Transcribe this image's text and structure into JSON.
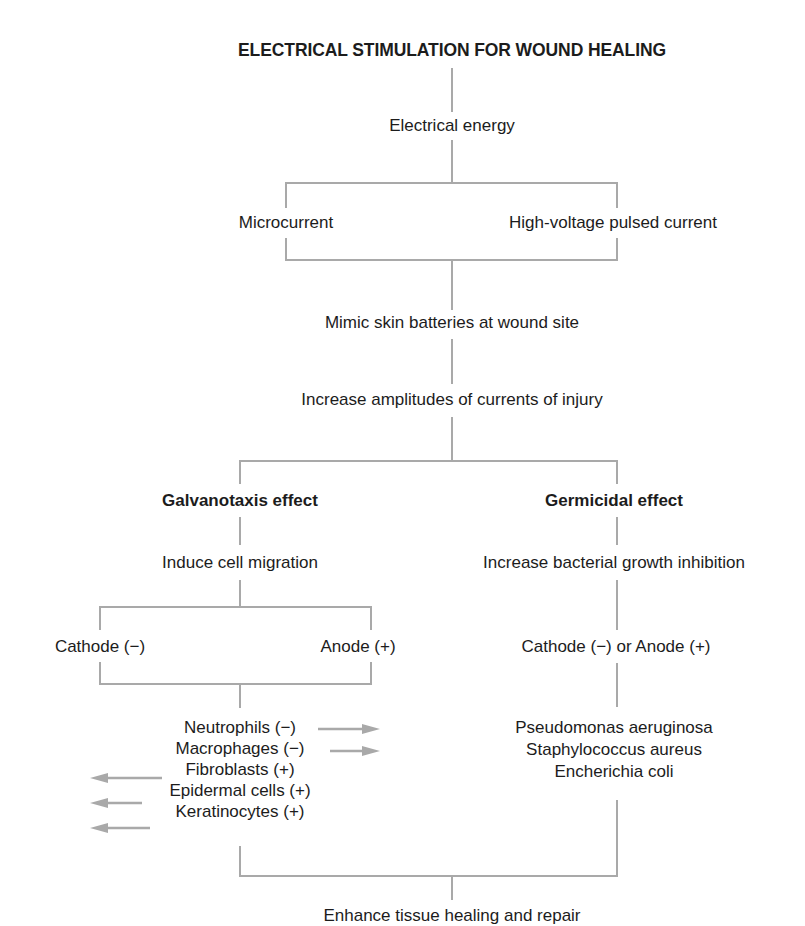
{
  "title": "ELECTRICAL STIMULATION FOR WOUND HEALING",
  "nodes": {
    "electrical_energy": "Electrical energy",
    "microcurrent": "Microcurrent",
    "high_voltage": "High-voltage pulsed current",
    "mimic": "Mimic skin batteries at wound site",
    "increase_amplitudes": "Increase amplitudes of currents of injury",
    "galvanotaxis": "Galvanotaxis effect",
    "germicidal": "Germicidal effect",
    "induce_migration": "Induce cell migration",
    "increase_inhibition": "Increase bacterial growth inhibition",
    "cathode": "Cathode (−)",
    "anode": "Anode (+)",
    "cathode_or_anode": "Cathode (−) or Anode (+)",
    "outcome": "Enhance tissue healing and repair"
  },
  "cells": [
    {
      "label": "Neutrophils (−)",
      "arrow": "right"
    },
    {
      "label": "Macrophages (−)",
      "arrow": "right"
    },
    {
      "label": "Fibroblasts (+)",
      "arrow": "left"
    },
    {
      "label": "Epidermal cells (+)",
      "arrow": "left"
    },
    {
      "label": "Keratinocytes (+)",
      "arrow": "left"
    }
  ],
  "bacteria": [
    "Pseudomonas aeruginosa",
    "Staphylococcus aureus",
    "Encherichia coli"
  ],
  "colors": {
    "line": "#a9a9a9",
    "text": "#1c1c1c"
  }
}
